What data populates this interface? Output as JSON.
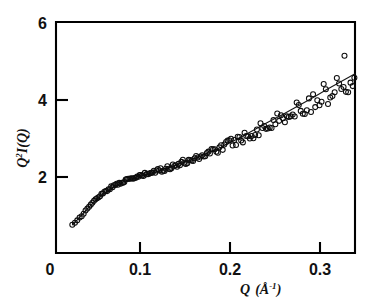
{
  "figure": {
    "kind": "scatter-plot-with-fit",
    "background_color": "#ffffff",
    "ink_color": "#000000"
  },
  "axes": {
    "x_title_main": "Q",
    "x_title_unit": "(Å",
    "x_title_exponent": "-1",
    "x_title_close": ")",
    "x_title_full": "Q (Å⁻¹)",
    "y_title_main": "Q",
    "y_title_exponent": "2",
    "y_title_rest": "I(Q)",
    "y_title_full": "Q²I(Q)",
    "x_tick_labels": [
      "0",
      "0.1",
      "0.2",
      "0.3"
    ],
    "x_tick_values": [
      0,
      0.1,
      0.2,
      0.3
    ],
    "y_tick_labels": [
      "2",
      "4",
      "6"
    ],
    "y_tick_values": [
      2,
      4,
      6
    ]
  },
  "chart_data": {
    "type": "scatter",
    "title": "",
    "subtitle": "",
    "xlabel": "Q (Å⁻¹)",
    "ylabel": "Q²I(Q)",
    "xlim": [
      0.0,
      0.3389
    ],
    "ylim": [
      0.0,
      6.0
    ],
    "xticks": [
      0,
      0.1,
      0.2,
      0.3
    ],
    "yticks": [
      2,
      4,
      6
    ],
    "grid": false,
    "legend": null,
    "legend_position": "none",
    "annotations": [],
    "marker_style": "open-circle",
    "marker_radius_px": 2.5,
    "series": [
      {
        "name": "measured",
        "type": "scatter",
        "x": [
          0.0248,
          0.0277,
          0.0303,
          0.0329,
          0.0352,
          0.0374,
          0.0395,
          0.0415,
          0.0434,
          0.0453,
          0.0471,
          0.0489,
          0.0506,
          0.0523,
          0.054,
          0.0556,
          0.0572,
          0.0588,
          0.0604,
          0.062,
          0.0635,
          0.065,
          0.0665,
          0.068,
          0.0695,
          0.071,
          0.0725,
          0.074,
          0.0754,
          0.0769,
          0.0783,
          0.0798,
          0.0812,
          0.0826,
          0.0841,
          0.0855,
          0.0869,
          0.0883,
          0.0897,
          0.0911,
          0.0925,
          0.094,
          0.0954,
          0.0968,
          0.0982,
          0.0996,
          0.101,
          0.1024,
          0.1038,
          0.1053,
          0.1067,
          0.1081,
          0.1096,
          0.111,
          0.1125,
          0.1139,
          0.1154,
          0.1169,
          0.1183,
          0.1198,
          0.1213,
          0.1228,
          0.1243,
          0.1258,
          0.1273,
          0.1288,
          0.1304,
          0.1319,
          0.1334,
          0.135,
          0.1365,
          0.1381,
          0.1397,
          0.1412,
          0.1428,
          0.1444,
          0.146,
          0.1476,
          0.1492,
          0.1508,
          0.1525,
          0.1541,
          0.1557,
          0.1574,
          0.159,
          0.1607,
          0.1624,
          0.164,
          0.1657,
          0.1674,
          0.1691,
          0.1708,
          0.1725,
          0.1743,
          0.176,
          0.1777,
          0.1795,
          0.1812,
          0.183,
          0.1848,
          0.1865,
          0.1883,
          0.1901,
          0.1919,
          0.1937,
          0.1956,
          0.1974,
          0.1992,
          0.2011,
          0.2029,
          0.2048,
          0.2067,
          0.2086,
          0.2105,
          0.2124,
          0.2143,
          0.2162,
          0.2181,
          0.2201,
          0.222,
          0.224,
          0.226,
          0.2279,
          0.2299,
          0.2319,
          0.2339,
          0.236,
          0.238,
          0.24,
          0.2421,
          0.2441,
          0.2462,
          0.2483,
          0.2504,
          0.2525,
          0.2546,
          0.2567,
          0.2589,
          0.261,
          0.2632,
          0.2653,
          0.2675,
          0.2697,
          0.2719,
          0.2741,
          0.2764,
          0.2786,
          0.2809,
          0.2831,
          0.2854,
          0.2877,
          0.29,
          0.2923,
          0.2947,
          0.297,
          0.2994,
          0.3017,
          0.3041,
          0.3065,
          0.3089,
          0.3114,
          0.3138,
          0.3163,
          0.3187,
          0.3212,
          0.3237,
          0.3262,
          0.3272,
          0.3288,
          0.3313,
          0.3339,
          0.3364,
          0.3382
        ],
        "y": [
          0.75,
          0.8,
          0.86,
          0.93,
          1.0,
          1.06,
          1.12,
          1.18,
          1.23,
          1.28,
          1.33,
          1.37,
          1.41,
          1.45,
          1.49,
          1.52,
          1.55,
          1.58,
          1.61,
          1.64,
          1.66,
          1.69,
          1.71,
          1.73,
          1.75,
          1.77,
          1.79,
          1.81,
          1.82,
          1.84,
          1.85,
          1.87,
          1.88,
          1.89,
          1.91,
          1.92,
          1.93,
          1.94,
          1.95,
          1.96,
          1.97,
          1.98,
          1.99,
          2.0,
          2.01,
          2.02,
          2.03,
          2.04,
          2.05,
          2.06,
          2.07,
          2.08,
          2.09,
          2.1,
          2.11,
          2.12,
          2.13,
          2.14,
          2.15,
          2.16,
          2.17,
          2.18,
          2.19,
          2.2,
          2.21,
          2.22,
          2.24,
          2.25,
          2.26,
          2.27,
          2.28,
          2.3,
          2.31,
          2.32,
          2.33,
          2.35,
          2.36,
          2.37,
          2.39,
          2.4,
          2.41,
          2.43,
          2.44,
          2.46,
          2.47,
          2.49,
          2.5,
          2.52,
          2.53,
          2.55,
          2.56,
          2.58,
          2.6,
          2.61,
          2.63,
          2.65,
          2.66,
          2.68,
          2.7,
          2.72,
          2.73,
          2.75,
          2.77,
          2.79,
          2.81,
          2.83,
          2.85,
          2.87,
          2.89,
          2.91,
          2.93,
          2.95,
          2.97,
          2.99,
          3.01,
          3.03,
          3.05,
          3.07,
          3.09,
          3.12,
          3.14,
          3.16,
          3.18,
          3.21,
          3.23,
          3.25,
          3.28,
          3.3,
          3.32,
          3.35,
          3.37,
          3.4,
          3.42,
          3.45,
          3.47,
          3.5,
          3.52,
          3.55,
          3.58,
          3.6,
          3.63,
          3.66,
          3.68,
          3.71,
          3.74,
          3.77,
          3.8,
          3.82,
          3.85,
          3.88,
          3.91,
          3.94,
          3.97,
          4.0,
          4.03,
          4.06,
          4.09,
          4.13,
          4.16,
          4.19,
          4.22,
          4.26,
          4.29,
          4.32,
          4.36,
          4.39,
          4.43,
          5.15,
          4.46,
          4.5,
          4.53,
          4.57,
          4.61
        ],
        "scatter_amplitude": [
          0.02,
          0.02,
          0.02,
          0.02,
          0.02,
          0.02,
          0.02,
          0.02,
          0.02,
          0.02,
          0.02,
          0.02,
          0.02,
          0.02,
          0.02,
          0.02,
          0.02,
          0.02,
          0.02,
          0.02,
          0.03,
          0.03,
          0.03,
          0.03,
          0.03,
          0.03,
          0.03,
          0.03,
          0.03,
          0.03,
          0.03,
          0.03,
          0.03,
          0.03,
          0.03,
          0.03,
          0.04,
          0.04,
          0.04,
          0.04,
          0.04,
          0.04,
          0.04,
          0.04,
          0.04,
          0.04,
          0.04,
          0.04,
          0.04,
          0.05,
          0.05,
          0.05,
          0.05,
          0.05,
          0.05,
          0.05,
          0.05,
          0.05,
          0.05,
          0.05,
          0.06,
          0.06,
          0.06,
          0.06,
          0.06,
          0.06,
          0.06,
          0.06,
          0.06,
          0.07,
          0.07,
          0.07,
          0.07,
          0.07,
          0.07,
          0.07,
          0.07,
          0.08,
          0.08,
          0.08,
          0.08,
          0.08,
          0.08,
          0.08,
          0.09,
          0.09,
          0.09,
          0.09,
          0.09,
          0.09,
          0.1,
          0.1,
          0.1,
          0.1,
          0.1,
          0.1,
          0.11,
          0.11,
          0.11,
          0.11,
          0.11,
          0.12,
          0.12,
          0.12,
          0.12,
          0.12,
          0.13,
          0.13,
          0.13,
          0.13,
          0.14,
          0.14,
          0.14,
          0.14,
          0.15,
          0.15,
          0.15,
          0.15,
          0.16,
          0.16,
          0.16,
          0.16,
          0.17,
          0.17,
          0.17,
          0.18,
          0.18,
          0.18,
          0.18,
          0.19,
          0.19,
          0.19,
          0.2,
          0.2,
          0.2,
          0.21,
          0.21,
          0.21,
          0.22,
          0.22,
          0.22,
          0.23,
          0.23,
          0.23,
          0.24,
          0.24,
          0.25,
          0.25,
          0.25,
          0.26,
          0.26,
          0.27,
          0.27,
          0.27,
          0.28,
          0.28,
          0.29,
          0.29,
          0.3,
          0.3,
          0.31,
          0.31,
          0.32,
          0.32,
          0.33,
          0.33,
          0.34,
          0.0,
          0.34,
          0.35,
          0.36,
          0.36,
          0.37
        ]
      },
      {
        "name": "model-fit",
        "type": "line",
        "x": [
          0.025,
          0.035,
          0.045,
          0.055,
          0.065,
          0.075,
          0.085,
          0.095,
          0.105,
          0.115,
          0.125,
          0.135,
          0.145,
          0.155,
          0.165,
          0.175,
          0.185,
          0.195,
          0.205,
          0.215,
          0.225,
          0.235,
          0.245,
          0.255,
          0.265,
          0.275,
          0.285,
          0.295,
          0.305,
          0.315,
          0.325,
          0.335,
          0.3389
        ],
        "y": [
          0.76,
          1.0,
          1.27,
          1.49,
          1.66,
          1.8,
          1.91,
          1.99,
          2.05,
          2.11,
          2.19,
          2.27,
          2.35,
          2.43,
          2.52,
          2.62,
          2.72,
          2.83,
          2.95,
          3.07,
          3.2,
          3.33,
          3.46,
          3.58,
          3.71,
          3.84,
          3.97,
          4.1,
          4.24,
          4.37,
          4.5,
          4.63,
          4.68
        ]
      }
    ]
  },
  "geometry": {
    "frame_left_px": 56,
    "frame_right_px": 355,
    "frame_top_px": 22,
    "frame_bottom_px": 253,
    "x_origin_px": 50,
    "x_scale_px_per_unit": 900,
    "y_zero_px": 254,
    "y_scale_px_per_unit": 38.5
  }
}
